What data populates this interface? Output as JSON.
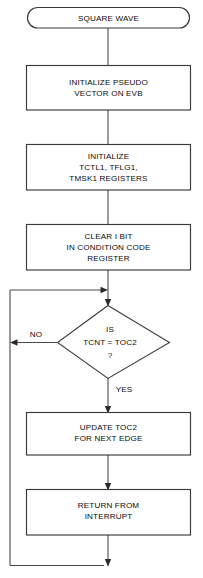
{
  "diagram": {
    "title": "SQUARE WAVE",
    "type": "flowchart",
    "nodes": [
      {
        "id": "start",
        "shape": "terminator",
        "lines": [
          "SQUARE WAVE"
        ]
      },
      {
        "id": "init-pseudo-vector",
        "shape": "process",
        "lines": [
          "INITIALIZE PSEUDO",
          "VECTOR ON EVB"
        ]
      },
      {
        "id": "init-registers",
        "shape": "process",
        "lines": [
          "INITIALIZE",
          "TCTL1, TFLG1,",
          "TMSK1 REGISTERS"
        ]
      },
      {
        "id": "clear-i-bit",
        "shape": "process",
        "lines": [
          "CLEAR I BIT",
          "IN CONDITION CODE",
          "REGISTER"
        ]
      },
      {
        "id": "compare-tcnt-toc2",
        "shape": "decision",
        "lines": [
          "IS",
          "TCNT = TOC2",
          "?"
        ]
      },
      {
        "id": "update-toc2",
        "shape": "process",
        "lines": [
          "UPDATE TOC2",
          "FOR NEXT EDGE"
        ]
      },
      {
        "id": "return-from-interrupt",
        "shape": "process",
        "lines": [
          "RETURN FROM",
          "INTERRUPT"
        ]
      }
    ],
    "edge_labels": {
      "no": "NO",
      "yes": "YES"
    },
    "colors": {
      "background": "#ffffff",
      "shape_stroke": "#3a3a3a",
      "connector_stroke": "#4a4a4a",
      "text": "#0c0c0c"
    }
  }
}
